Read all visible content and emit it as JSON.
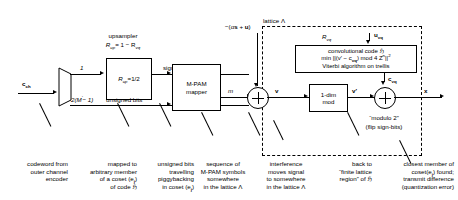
{
  "diagram": {
    "lattice_label": "lattice Λ",
    "input_signal": "c",
    "input_signal_sub": "ch",
    "interference_label": "−(αs + u)",
    "labels": {
      "upsampler_title": "upsampler",
      "upsampler_rate_lhs": "R",
      "upsampler_rate_lhs_sub": "up",
      "upsampler_rate_rhs": "= 1 − R",
      "upsampler_rate_rhs_sub": "vq",
      "branch_top": "1",
      "branch_bottom_pre": "2(M",
      "branch_bottom_sup": "′",
      "branch_bottom_post": "− 1)",
      "sign_bits": "sign-bits c",
      "sign_bits_sub": "up",
      "unsigned_bits": "unsigned bits",
      "m_label": "m",
      "v_label": "v",
      "v_prime_label": "v′",
      "x_label": "x",
      "c_vq_label": "c",
      "c_vq_sub": "vq",
      "u_vq_label": "u",
      "u_vq_sub": "vq",
      "r_vq_label": "R",
      "r_vq_sub": "vq",
      "modulo_two": "“modulo 2”",
      "flip_sign_bits": "(flip sign-bits)"
    },
    "blocks": {
      "upsampler_box": {
        "lhs": "R",
        "lhs_sub": "up",
        "rhs": "=1/2"
      },
      "mpam_line1": "M-PAM",
      "mpam_line2": "mapper",
      "onedim_line1": "1-dim",
      "onedim_line2": "mod",
      "conv_line1": "convolutional code ℌ",
      "conv_line2_a": "min ||(v′ − c",
      "conv_line2_sub": "vq",
      "conv_line2_b": ") mod 4 Z",
      "conv_line2_sup": "n",
      "conv_line2_c": "||",
      "conv_line2_sup2": "2",
      "conv_line3": "Viterbi algorithm on trellis"
    },
    "captions": [
      {
        "name": "codeword-caption",
        "align": "right",
        "lines": [
          "codeword from",
          "outer channel",
          "encoder"
        ]
      },
      {
        "name": "coset-caption",
        "align": "right",
        "lines": [
          "mapped to",
          "arbitrary member",
          "of a coset (e",
          "of code ℌ"
        ],
        "coset_sub": "j",
        "coset_tail": ")"
      },
      {
        "name": "unsigned-bits-caption",
        "align": "right",
        "lines": [
          "unsigned bits",
          "travelling",
          "piggybacking",
          "in coset (e"
        ],
        "coset_sub": "j",
        "coset_tail": ")"
      },
      {
        "name": "mpam-sequence-caption",
        "align": "center",
        "lines": [
          "sequence of",
          "M-PAM symbols",
          "somewhere",
          "in the lattice Λ"
        ]
      },
      {
        "name": "interference-caption",
        "align": "center",
        "lines": [
          "interference",
          "moves signal",
          "to somewhere",
          "in the lattice Λ"
        ]
      },
      {
        "name": "finite-lattice-caption",
        "align": "right",
        "lines": [
          "back to",
          "“finite lattice",
          "region” of ℌ"
        ]
      },
      {
        "name": "closest-member-caption",
        "align": "right",
        "lines": [
          "closest member of",
          "coset(e",
          "transmit difference",
          "(quantization error)"
        ],
        "coset_sub": "j",
        "coset_tail": ") found;"
      }
    ],
    "colors": {
      "ink": "#000000",
      "paper": "#ffffff"
    }
  }
}
